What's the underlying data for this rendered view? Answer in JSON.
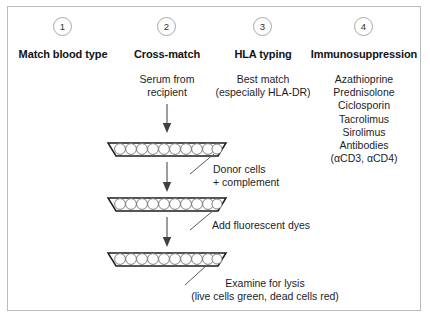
{
  "columns": [
    {
      "number": "1",
      "heading": "Match blood type",
      "body": []
    },
    {
      "number": "2",
      "heading": "Cross-match",
      "body": [
        "Serum from",
        "recipient"
      ]
    },
    {
      "number": "3",
      "heading": "HLA typing",
      "body": [
        "Best match",
        "(especially HLA-DR)"
      ]
    },
    {
      "number": "4",
      "heading": "Immunosuppression",
      "body": [
        "Azathioprine",
        "Prednisolone",
        "Ciclosporin",
        "Tacrolimus",
        "Sirolimus",
        "Antibodies",
        "(αCD3, αCD4)"
      ]
    }
  ],
  "annotations": {
    "donor_cells_line1": "Donor cells",
    "donor_cells_line2": "+ complement",
    "fluorescent_dyes": "Add fluorescent dyes",
    "examine_line1": "Examine for lysis",
    "examine_line2": "(live cells green, dead cells red)"
  },
  "trays": {
    "count": 3,
    "wells_per_tray": 10,
    "label": "microtitre well tray with cells"
  },
  "colors": {
    "frame_border": "#b9bcbe",
    "text": "#1b1d1f",
    "heading_text": "#111315",
    "circle_stroke": "#a8abad",
    "tray_stroke": "#1a1c1e",
    "well_stroke": "#6f7376",
    "arrow": "#58595b",
    "leader_line": "#58595b",
    "background": "#ffffff"
  }
}
